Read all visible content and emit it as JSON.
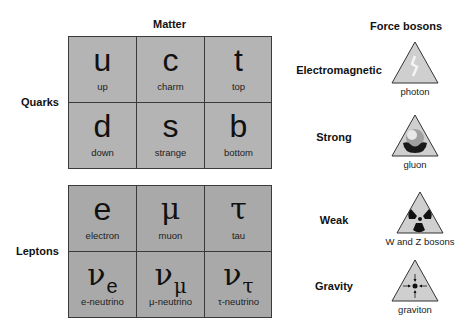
{
  "headings": {
    "matter": "Matter",
    "force_bosons": "Force bosons"
  },
  "quarks": {
    "label": "Quarks",
    "cells": [
      {
        "symbol": "u",
        "name": "up"
      },
      {
        "symbol": "c",
        "name": "charm"
      },
      {
        "symbol": "t",
        "name": "top"
      },
      {
        "symbol": "d",
        "name": "down"
      },
      {
        "symbol": "s",
        "name": "strange"
      },
      {
        "symbol": "b",
        "name": "bottom"
      }
    ]
  },
  "leptons": {
    "label": "Leptons",
    "cells": [
      {
        "symbol": "e",
        "sub": "",
        "name": "electron"
      },
      {
        "symbol": "μ",
        "sub": "",
        "name": "muon"
      },
      {
        "symbol": "τ",
        "sub": "",
        "name": "tau"
      },
      {
        "symbol": "ν",
        "sub": "e",
        "name": "e-neutrino"
      },
      {
        "symbol": "ν",
        "sub": "μ",
        "name": "μ-neutrino"
      },
      {
        "symbol": "ν",
        "sub": "τ",
        "name": "τ-neutrino"
      }
    ]
  },
  "forces": [
    {
      "force": "Electromagnetic",
      "boson": "photon",
      "icon": "lightning-icon"
    },
    {
      "force": "Strong",
      "boson": "gluon",
      "icon": "color-charge-icon"
    },
    {
      "force": "Weak",
      "boson": "W and Z bosons",
      "icon": "radiation-icon"
    },
    {
      "force": "Gravity",
      "boson": "graviton",
      "icon": "converging-arrows-icon"
    }
  ],
  "colors": {
    "quarks_fill": "#b4b4b4",
    "leptons_fill": "#a9a9a9",
    "grid_line": "#3a3a3a",
    "triangle_fill": "#d0d0d0"
  }
}
